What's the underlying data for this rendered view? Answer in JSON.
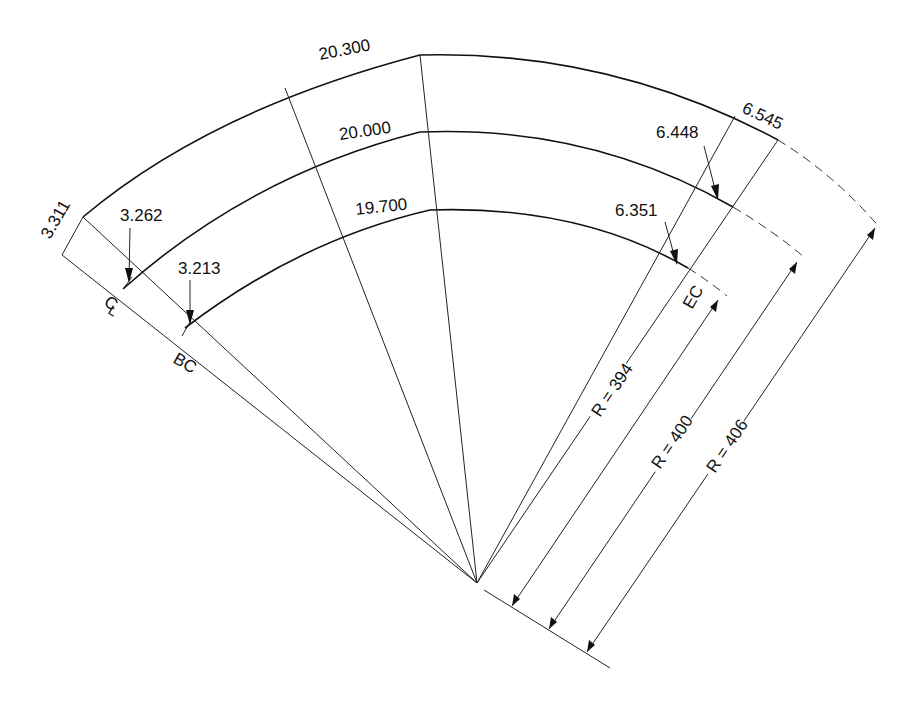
{
  "diagram": {
    "type": "circular curve with offset arcs (stakeout diagram)",
    "arcs": {
      "outer": {
        "length_label": "20.300",
        "end_chord": "6.545",
        "start_chord": "3.311",
        "radius_label": "R = 406"
      },
      "centerline": {
        "length_label": "20.000",
        "end_chord": "6.448",
        "start_chord": "3.262",
        "radius_label": "R = 400"
      },
      "inner": {
        "length_label": "19.700",
        "end_chord": "6.351",
        "start_chord": "3.213",
        "radius_label": "R = 394"
      }
    },
    "point_labels": {
      "centerline": "CL",
      "begin_curve": "BC",
      "end_curve": "EC"
    },
    "labels": {
      "outer_length": "20.300",
      "mid_length": "20.000",
      "inner_length": "19.700",
      "outer_end": "6.545",
      "mid_end": "6.448",
      "inner_end": "6.351",
      "outer_start": "3.311",
      "mid_start": "3.262",
      "inner_start": "3.213",
      "r_inner": "R = 394",
      "r_mid": "R = 400",
      "r_outer": "R = 406",
      "cl": "C",
      "cl_sub": "L",
      "bc": "BC",
      "ec": "EC"
    }
  }
}
